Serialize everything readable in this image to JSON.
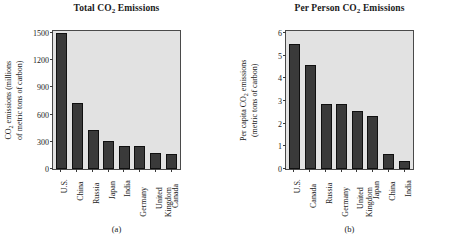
{
  "figure": {
    "panels": [
      {
        "id": "a",
        "caption": "(a)",
        "title_pre": "Total CO",
        "title_sub": "2",
        "title_post": " Emissions",
        "ylabel_line1_pre": "CO",
        "ylabel_line1_sub": "2",
        "ylabel_line1_post": " emissions (millions",
        "ylabel_line2": "of metric tons of carbon)"
      },
      {
        "id": "b",
        "caption": "(b)",
        "title_pre": "Per Person CO",
        "title_sub": "2",
        "title_post": " Emissions",
        "ylabel_line1_pre": "Per capita CO",
        "ylabel_line1_sub": "2",
        "ylabel_line1_post": " emissions",
        "ylabel_line2": "(metric tons of carbon)"
      }
    ]
  },
  "chart_data": [
    {
      "type": "bar",
      "title": "Total CO2 Emissions",
      "xlabel": "",
      "ylabel": "CO2 emissions (millions of metric tons of carbon)",
      "ylim": [
        0,
        1500
      ],
      "yticks": [
        0,
        300,
        600,
        900,
        1200,
        1500
      ],
      "ytick_labels": [
        "0",
        "300",
        "600",
        "900",
        "1200",
        "1500"
      ],
      "grid": false,
      "legend": "none",
      "bar_color": "#3a3a3a",
      "plot_background": "#e2e2e2",
      "categories": [
        "U.S.",
        "China",
        "Russia",
        "Japan",
        "India",
        "Germany",
        "United Kingdom",
        "Canada"
      ],
      "category_lines": [
        [
          "U.S."
        ],
        [
          "China"
        ],
        [
          "Russia"
        ],
        [
          "Japan"
        ],
        [
          "India"
        ],
        [
          "Germany"
        ],
        [
          "United",
          "Kingdom"
        ],
        [
          "Canada"
        ]
      ],
      "values": [
        1500,
        725,
        430,
        310,
        250,
        250,
        175,
        170
      ]
    },
    {
      "type": "bar",
      "title": "Per Person CO2 Emissions",
      "xlabel": "",
      "ylabel": "Per capita CO2 emissions (metric tons of carbon)",
      "ylim": [
        0,
        6
      ],
      "yticks": [
        0,
        1,
        2,
        3,
        4,
        5,
        6
      ],
      "ytick_labels": [
        "0",
        "1",
        "2",
        "3",
        "4",
        "5",
        "6"
      ],
      "grid": false,
      "legend": "none",
      "bar_color": "#3a3a3a",
      "plot_background": "#e2e2e2",
      "categories": [
        "U.S.",
        "Canada",
        "Russia",
        "Germany",
        "United Kingdom",
        "Japan",
        "China",
        "India"
      ],
      "category_lines": [
        [
          "U.S."
        ],
        [
          "Canada"
        ],
        [
          "Russia"
        ],
        [
          "Germany"
        ],
        [
          "United",
          "Kingdom"
        ],
        [
          "Japan"
        ],
        [
          "China"
        ],
        [
          "India"
        ]
      ],
      "values": [
        5.5,
        4.6,
        2.85,
        2.85,
        2.55,
        2.35,
        0.65,
        0.37
      ]
    }
  ]
}
